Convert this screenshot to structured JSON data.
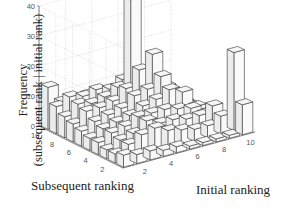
{
  "chart_data": {
    "type": "bar3d",
    "title": "",
    "xlabel": "Initial ranking",
    "ylabel": "Subsequent ranking",
    "zlabel_line1": "Frequency",
    "zlabel_line2": "(subsequent rank | initial rank)",
    "x_ticks": [
      2,
      4,
      6,
      8,
      10
    ],
    "y_ticks": [
      2,
      4,
      6,
      8,
      10
    ],
    "z_ticks": [
      0,
      10,
      20,
      30,
      40
    ],
    "zlim": [
      0,
      40
    ],
    "grid": true,
    "bar_color": "#f2f2f2",
    "edge_color": "#333333",
    "x_categories": [
      1,
      2,
      3,
      4,
      5,
      6,
      7,
      8,
      9,
      10
    ],
    "y_categories": [
      1,
      2,
      3,
      4,
      5,
      6,
      7,
      8,
      9,
      10
    ],
    "values_by_subsequent_rank": [
      [
        4,
        3,
        3,
        2,
        2,
        1,
        1,
        1,
        1,
        10
      ],
      [
        3,
        5,
        7,
        8,
        6,
        5,
        4,
        4,
        6,
        26
      ],
      [
        3,
        5,
        6,
        9,
        7,
        7,
        6,
        6,
        8,
        3
      ],
      [
        4,
        6,
        7,
        9,
        9,
        9,
        8,
        7,
        4,
        1
      ],
      [
        4,
        6,
        7,
        8,
        10,
        11,
        13,
        11,
        5,
        2
      ],
      [
        5,
        7,
        8,
        9,
        12,
        13,
        16,
        8,
        4,
        1
      ],
      [
        6,
        9,
        9,
        10,
        13,
        18,
        22,
        10,
        3,
        1
      ],
      [
        7,
        10,
        9,
        10,
        12,
        40,
        14,
        7,
        2,
        1
      ],
      [
        9,
        11,
        10,
        11,
        10,
        12,
        6,
        4,
        2,
        1
      ],
      [
        14,
        8,
        7,
        8,
        6,
        5,
        3,
        2,
        1,
        1
      ]
    ]
  }
}
